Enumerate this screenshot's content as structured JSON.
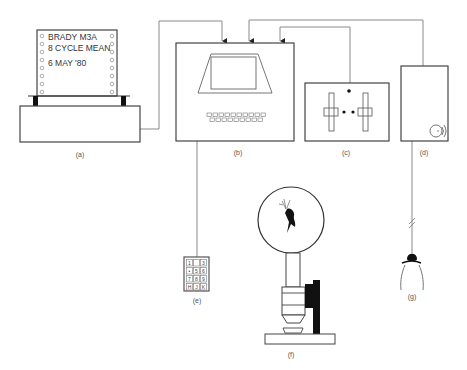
{
  "diagram": {
    "components": [
      {
        "id": "a",
        "label": "(a)",
        "name": "printer"
      },
      {
        "id": "b",
        "label": "(b)",
        "name": "computer-terminal"
      },
      {
        "id": "c",
        "label": "(c)",
        "name": "control-panel"
      },
      {
        "id": "d",
        "label": "(d)",
        "name": "sound-unit"
      },
      {
        "id": "e",
        "label": "(e)",
        "name": "keypad"
      },
      {
        "id": "f",
        "label": "(f)",
        "name": "microscope"
      },
      {
        "id": "g",
        "label": "(g)",
        "name": "microphone-probe"
      }
    ],
    "printout": {
      "line1": "BRADY M3A",
      "line2": "8 CYCLE MEAN",
      "line3": "6 MAY '80"
    },
    "keypad_keys": [
      "1",
      "",
      "3",
      "•",
      "5",
      "6",
      "7",
      "8",
      "9",
      "H",
      "J",
      "K"
    ],
    "connections": [
      {
        "from": "a",
        "to": "b"
      },
      {
        "from": "d",
        "to": "b"
      },
      {
        "from": "c",
        "to": "b"
      },
      {
        "from": "b",
        "to": "e"
      },
      {
        "from": "d",
        "to": "g"
      }
    ],
    "colors": {
      "line": "#8a8a8a",
      "outline": "#444444",
      "fill_dark": "#111111"
    }
  }
}
